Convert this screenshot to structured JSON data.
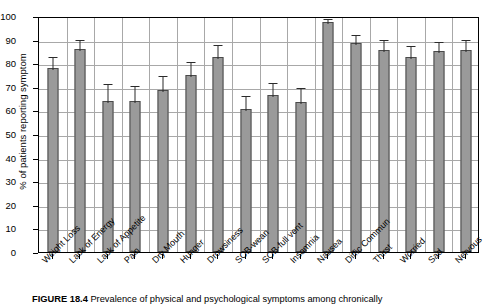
{
  "chart_data": {
    "type": "bar",
    "title": "",
    "xlabel": "",
    "ylabel": "% of patients reporting symptom",
    "ylim": [
      0,
      100
    ],
    "ytick_step": 10,
    "yticks": [
      "100",
      "90",
      "80",
      "70",
      "60",
      "50",
      "40",
      "30",
      "20",
      "10",
      "0"
    ],
    "grid": true,
    "legend": "none",
    "bar_color": "#9a9a9a",
    "bar_border_color": "#4a4a4a",
    "error_bar_color": "#2b2b2b",
    "categories": [
      "Weight Loss",
      "Lack of Energy",
      "Lack of Appetite",
      "Pain",
      "Dry Mouth",
      "Hunger",
      "Drowsiness",
      "SOB-wean",
      "SOB-full vent",
      "Insomnia",
      "Nausea",
      "Diffic Commun",
      "Thirst",
      "Worried",
      "Sad",
      "Nervous"
    ],
    "values": [
      78,
      86,
      64,
      64,
      68.5,
      75,
      82.5,
      60.5,
      66.5,
      63.5,
      97.5,
      88.5,
      85.5,
      82.5,
      85,
      85.5
    ],
    "errors": [
      5.5,
      4.5,
      8,
      7,
      7,
      6.5,
      6,
      6.5,
      6,
      7,
      2,
      4.5,
      5,
      5.5,
      5,
      5
    ]
  },
  "caption": {
    "figure_number": "FIGURE 18.4",
    "text": "Prevalence of physical and psychological symptoms among chronically"
  }
}
